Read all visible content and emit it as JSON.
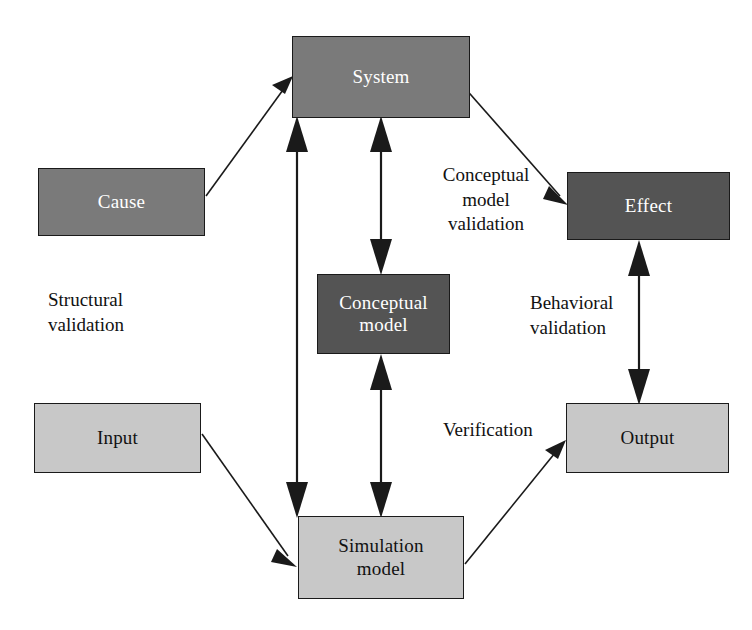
{
  "diagram": {
    "type": "flow-diagram",
    "colors": {
      "mid_gray": "#7a7a7a",
      "dark_gray": "#545454",
      "light_gray": "#c8c8c8",
      "stroke": "#1a1a1a",
      "text_light": "#ffffff",
      "text_dark": "#111111",
      "background": "#ffffff"
    },
    "nodes": [
      {
        "id": "system",
        "label": "System",
        "fill": "mid",
        "x": 292,
        "y": 36,
        "w": 178,
        "h": 82
      },
      {
        "id": "cause",
        "label": "Cause",
        "fill": "mid",
        "x": 38,
        "y": 168,
        "w": 167,
        "h": 68
      },
      {
        "id": "effect",
        "label": "Effect",
        "fill": "dark",
        "x": 567,
        "y": 172,
        "w": 163,
        "h": 68
      },
      {
        "id": "conceptual-model",
        "label": "Conceptual\nmodel",
        "fill": "dark",
        "x": 317,
        "y": 274,
        "w": 133,
        "h": 80
      },
      {
        "id": "input",
        "label": "Input",
        "fill": "light",
        "x": 34,
        "y": 403,
        "w": 167,
        "h": 70
      },
      {
        "id": "output",
        "label": "Output",
        "fill": "light",
        "x": 566,
        "y": 403,
        "w": 163,
        "h": 70
      },
      {
        "id": "simulation-model",
        "label": "Simulation\nmodel",
        "fill": "light",
        "x": 298,
        "y": 516,
        "w": 166,
        "h": 83
      }
    ],
    "edge_labels": [
      {
        "id": "conceptual-model-validation",
        "text": "Conceptual\nmodel\nvalidation",
        "align": "center",
        "x": 423,
        "y": 163,
        "w": 126
      },
      {
        "id": "structural-validation",
        "text": "Structural\nvalidation",
        "align": "left",
        "x": 48,
        "y": 288,
        "w": 140
      },
      {
        "id": "behavioral-validation",
        "text": "Behavioral\nvalidation",
        "align": "left",
        "x": 530,
        "y": 291,
        "w": 130
      },
      {
        "id": "verification",
        "text": "Verification",
        "align": "left",
        "x": 443,
        "y": 418,
        "w": 120
      }
    ],
    "edges": [
      {
        "id": "cause-to-system",
        "from": "cause",
        "to": "system",
        "arrows": "single"
      },
      {
        "id": "system-to-effect",
        "from": "system",
        "to": "effect",
        "arrows": "single"
      },
      {
        "id": "simulation-model-to-system",
        "from": "simulation model",
        "to": "system",
        "arrows": "double",
        "label": "structural-validation"
      },
      {
        "id": "system-to-conceptual-model",
        "from": "system",
        "to": "conceptual model",
        "arrows": "double",
        "label": "conceptual-model-validation"
      },
      {
        "id": "conceptual-model-to-simulation",
        "from": "conceptual model",
        "to": "simulation model",
        "arrows": "double"
      },
      {
        "id": "effect-to-output",
        "from": "effect",
        "to": "output",
        "arrows": "double",
        "label": "behavioral-validation"
      },
      {
        "id": "input-to-simulation-model",
        "from": "input",
        "to": "simulation model",
        "arrows": "single"
      },
      {
        "id": "simulation-model-to-output",
        "from": "simulation model",
        "to": "output",
        "arrows": "single",
        "label": "verification"
      }
    ]
  }
}
